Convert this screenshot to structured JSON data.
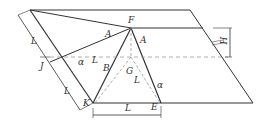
{
  "diagram": {
    "labels": {
      "F": "F",
      "A_left": "A",
      "A_right": "A",
      "J": "J",
      "alpha_left": "α",
      "L_mid": "L",
      "B": "B",
      "G": "G",
      "L_slant": "L",
      "alpha_right": "α",
      "K": "K",
      "E": "E",
      "L_bottom": "L",
      "L_left_upper": "L",
      "L_left_lower": "L",
      "H": "H"
    },
    "colors": {
      "line": "#333333",
      "dash": "#999999"
    }
  }
}
